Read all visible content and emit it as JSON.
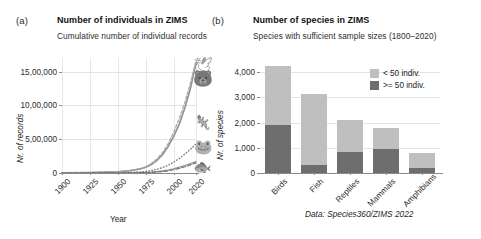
{
  "figure": {
    "source_note": "Data: Species360/ZIMS 2022"
  },
  "panel_a": {
    "tag": "(a)",
    "title": "Number of individuals in ZIMS",
    "subtitle": "Cumulative number of individual records",
    "icons": [
      {
        "name": "bird-icon",
        "glyph": "🕊"
      },
      {
        "name": "mammal-icon",
        "glyph": "🐻"
      },
      {
        "name": "reptile-icon",
        "glyph": "🦎"
      },
      {
        "name": "amphibian-icon",
        "glyph": "🐸"
      },
      {
        "name": "fish-icon",
        "glyph": "🐟"
      }
    ]
  },
  "panel_b": {
    "tag": "(b)",
    "title": "Number of species in ZIMS",
    "subtitle": "Species with sufficient sample sizes (1800–2020)"
  },
  "colors": {
    "light_gray": "#bfbfbf",
    "dark_gray": "#6e6e6e",
    "line_primary": "#8c8c8c",
    "grid": "#e3e3e3",
    "axis": "#8a8a8a"
  },
  "chart_data": [
    {
      "type": "line",
      "panel": "a",
      "title": "Number of individuals in ZIMS",
      "subtitle": "Cumulative number of individual records",
      "xlabel": "Year",
      "ylabel": "Nr. of records",
      "xlim": [
        1900,
        2020
      ],
      "ylim": [
        0,
        1700000
      ],
      "xticks": [
        1900,
        1925,
        1950,
        1975,
        2000,
        2020
      ],
      "xtick_labels": [
        "1900",
        "1925",
        "1950",
        "1975",
        "2000",
        "2020"
      ],
      "yticks": [
        0,
        500000,
        1000000,
        1500000
      ],
      "ytick_labels": [
        "0",
        "5,00,000",
        "10,00,000",
        "15,00,000"
      ],
      "grid": true,
      "legend": "none",
      "x": [
        1900,
        1925,
        1950,
        1960,
        1970,
        1975,
        1980,
        1985,
        1990,
        1995,
        2000,
        2005,
        2010,
        2015,
        2020
      ],
      "series": [
        {
          "name": "Birds",
          "style": "solid",
          "values": [
            2000,
            6000,
            18000,
            32000,
            60000,
            85000,
            125000,
            185000,
            270000,
            390000,
            540000,
            720000,
            960000,
            1250000,
            1620000
          ]
        },
        {
          "name": "Mammals",
          "style": "dashed",
          "values": [
            2500,
            7000,
            20000,
            35000,
            66000,
            95000,
            140000,
            205000,
            300000,
            430000,
            600000,
            800000,
            1040000,
            1330000,
            1660000
          ]
        },
        {
          "name": "Reptiles",
          "style": "dotted",
          "values": [
            500,
            1500,
            4500,
            8000,
            16000,
            24000,
            36000,
            54000,
            80000,
            115000,
            160000,
            215000,
            280000,
            350000,
            430000
          ]
        },
        {
          "name": "Amphibians",
          "style": "solid-thin",
          "values": [
            200,
            600,
            1800,
            3200,
            6500,
            9500,
            14000,
            21000,
            31000,
            45000,
            64000,
            87000,
            112000,
            140000,
            168000
          ]
        },
        {
          "name": "Fish",
          "style": "dash-dot",
          "values": [
            150,
            400,
            1200,
            2200,
            4500,
            6800,
            10000,
            15000,
            22000,
            33000,
            48000,
            68000,
            92000,
            120000,
            150000
          ]
        }
      ]
    },
    {
      "type": "bar",
      "panel": "b",
      "subtype": "stacked",
      "title": "Number of species in ZIMS",
      "subtitle": "Species with sufficient sample sizes (1800–2020)",
      "xlabel": "",
      "ylabel": "Nr. of species",
      "ylim": [
        0,
        4400
      ],
      "yticks": [
        0,
        1000,
        2000,
        3000,
        4000
      ],
      "ytick_labels": [
        "0",
        "1,000",
        "2,000",
        "3,000",
        "4,000"
      ],
      "grid": true,
      "legend_position": "top-right",
      "categories": [
        "Birds",
        "Fish",
        "Reptiles",
        "Mammals",
        "Amphibians"
      ],
      "series": [
        {
          "name": ">= 50 indiv.",
          "color": "#6e6e6e",
          "values": [
            1900,
            300,
            850,
            950,
            200
          ]
        },
        {
          "name": "< 50 indiv.",
          "color": "#bfbfbf",
          "values": [
            2350,
            2850,
            1250,
            850,
            600
          ]
        }
      ],
      "totals": [
        4250,
        3150,
        2100,
        1800,
        800
      ]
    }
  ]
}
